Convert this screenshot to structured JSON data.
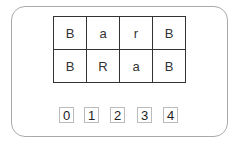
{
  "board": {
    "rows": [
      [
        "B",
        "a",
        "r",
        "B"
      ],
      [
        "B",
        "R",
        "a",
        "B"
      ]
    ]
  },
  "slots": [
    "0",
    "1",
    "2",
    "3",
    "4"
  ],
  "colors": {
    "grid_line": "#333333",
    "panel_border": "#aaaaaa",
    "slot_border": "#bbbbbb"
  }
}
